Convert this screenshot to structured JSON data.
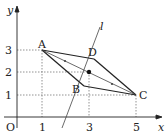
{
  "diagram": {
    "axes": {
      "x_label": "x",
      "y_label": "y",
      "origin_label": "O",
      "x_ticks": [
        "1",
        "3",
        "5"
      ],
      "y_ticks": [
        "1",
        "2",
        "3"
      ]
    },
    "points": {
      "A": {
        "label": "A",
        "coords": [
          1,
          3
        ]
      },
      "B": {
        "label": "B",
        "coords": [
          2.9,
          1.5
        ]
      },
      "C": {
        "label": "C",
        "coords": [
          5,
          1
        ]
      },
      "D": {
        "label": "D",
        "coords": [
          3.1,
          2.5
        ]
      },
      "center": {
        "coords": [
          3,
          2
        ]
      }
    },
    "line": {
      "label": "l"
    },
    "colors": {
      "stroke": "#222222",
      "dashed": "#777777"
    }
  }
}
